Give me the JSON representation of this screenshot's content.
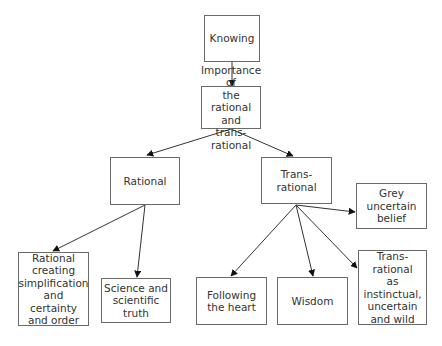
{
  "diagram": {
    "nodes": [
      {
        "id": "knowing",
        "label": "Knowing",
        "x": 204,
        "y": 15,
        "w": 56,
        "h": 47
      },
      {
        "id": "importance",
        "label": "Importance of\nthe rational and\ntrans-rational",
        "x": 201,
        "y": 86,
        "w": 60,
        "h": 43
      },
      {
        "id": "rational",
        "label": "Rational",
        "x": 110,
        "y": 157,
        "w": 70,
        "h": 48
      },
      {
        "id": "trans_rational",
        "label": "Trans-rational",
        "x": 261,
        "y": 157,
        "w": 71,
        "h": 47
      },
      {
        "id": "grey",
        "label": "Grey\nuncertain\nbelief",
        "x": 356,
        "y": 183,
        "w": 71,
        "h": 46
      },
      {
        "id": "rational_creating",
        "label": "Rational\ncreating\nsimplification\nand certainty\nand order",
        "x": 18,
        "y": 252,
        "w": 71,
        "h": 74
      },
      {
        "id": "science",
        "label": "Science and\nscientific\ntruth",
        "x": 101,
        "y": 278,
        "w": 70,
        "h": 45
      },
      {
        "id": "following",
        "label": "Following\nthe heart",
        "x": 196,
        "y": 277,
        "w": 71,
        "h": 48
      },
      {
        "id": "wisdom",
        "label": "Wisdom",
        "x": 277,
        "y": 277,
        "w": 71,
        "h": 48
      },
      {
        "id": "instinctual",
        "label": "Trans-rational\nas instinctual,\nuncertain\nand wild",
        "x": 358,
        "y": 250,
        "w": 69,
        "h": 75
      }
    ],
    "edges": [
      {
        "from": "knowing",
        "to": "importance",
        "x1": 232,
        "y1": 62,
        "x2": 232,
        "y2": 86
      },
      {
        "from": "importance",
        "to": "rational",
        "x1": 231,
        "y1": 129,
        "x2": 147,
        "y2": 155
      },
      {
        "from": "importance",
        "to": "trans_rational",
        "x1": 231,
        "y1": 129,
        "x2": 293,
        "y2": 156
      },
      {
        "from": "rational",
        "to": "rational_creating",
        "x1": 145,
        "y1": 205,
        "x2": 53,
        "y2": 251
      },
      {
        "from": "rational",
        "to": "science",
        "x1": 145,
        "y1": 205,
        "x2": 137,
        "y2": 277
      },
      {
        "from": "trans_rational",
        "to": "grey",
        "x1": 296,
        "y1": 205,
        "x2": 355,
        "y2": 212
      },
      {
        "from": "trans_rational",
        "to": "following",
        "x1": 296,
        "y1": 205,
        "x2": 231,
        "y2": 276
      },
      {
        "from": "trans_rational",
        "to": "wisdom",
        "x1": 296,
        "y1": 205,
        "x2": 313,
        "y2": 276
      },
      {
        "from": "trans_rational",
        "to": "instinctual",
        "x1": 296,
        "y1": 205,
        "x2": 357,
        "y2": 268
      }
    ]
  }
}
